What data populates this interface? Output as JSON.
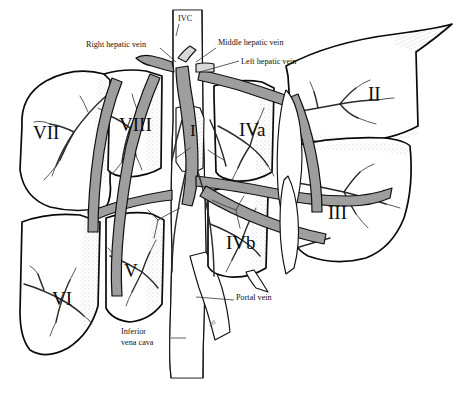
{
  "figure": {
    "name": "liver-segmental-anatomy-diagram",
    "kind": "anatomical-line-illustration",
    "background_color": "#ffffff",
    "ink_color": "#111111",
    "vessel_fill": "#d9d9d9",
    "vessel_fill_dark": "#9e9e9e"
  },
  "annotations": [
    {
      "id": "ivc-top",
      "text": "IVC",
      "x": 178,
      "y": 21,
      "size": 8.2,
      "anchor": "start"
    },
    {
      "id": "right-hepatic-vein",
      "text": "Right hepatic vein",
      "x": 86,
      "y": 47,
      "size": 8.2,
      "anchor": "start"
    },
    {
      "id": "middle-hepatic-vein",
      "text": "Middle hepatic vein",
      "x": 218,
      "y": 45,
      "size": 8.2,
      "anchor": "start"
    },
    {
      "id": "left-hepatic-vein",
      "text": "Left hepatic vein",
      "x": 241,
      "y": 64,
      "size": 8.2,
      "anchor": "start"
    },
    {
      "id": "portal-vein",
      "text": "Portal vein",
      "x": 236,
      "y": 300,
      "size": 8.2,
      "anchor": "start"
    },
    {
      "id": "inferior-vena-cava-1",
      "text": "Inferior",
      "x": 121,
      "y": 334,
      "size": 8.2,
      "anchor": "start"
    },
    {
      "id": "inferior-vena-cava-2",
      "text": "vena cava",
      "x": 121,
      "y": 345,
      "size": 8.2,
      "anchor": "start"
    }
  ],
  "segments": [
    {
      "id": "I",
      "label": "I",
      "x": 190,
      "y": 136,
      "size": 17
    },
    {
      "id": "II",
      "label": "II",
      "x": 368,
      "y": 100,
      "size": 19
    },
    {
      "id": "III",
      "label": "III",
      "x": 328,
      "y": 219,
      "size": 19
    },
    {
      "id": "IVa",
      "label": "IVa",
      "x": 239,
      "y": 136,
      "size": 19
    },
    {
      "id": "IVb",
      "label": "IVb",
      "x": 226,
      "y": 249,
      "size": 19
    },
    {
      "id": "V",
      "label": "V",
      "x": 124,
      "y": 277,
      "size": 19
    },
    {
      "id": "VI",
      "label": "VI",
      "x": 52,
      "y": 305,
      "size": 19
    },
    {
      "id": "VII",
      "label": "VII",
      "x": 33,
      "y": 139,
      "size": 19
    },
    {
      "id": "VIII",
      "label": "VIII",
      "x": 119,
      "y": 131,
      "size": 19
    }
  ],
  "signature": {
    "text": "art",
    "x": 210,
    "y": 327
  }
}
